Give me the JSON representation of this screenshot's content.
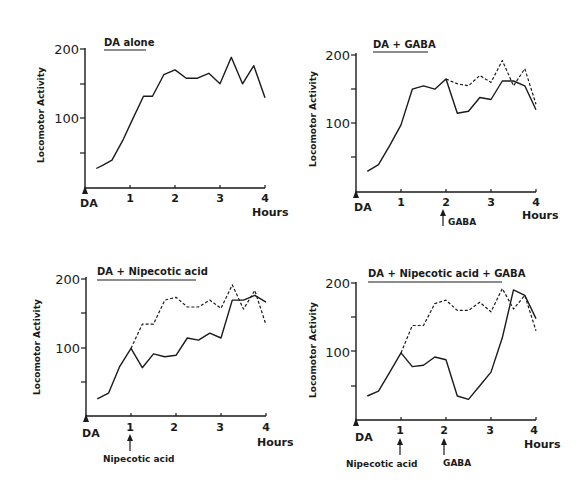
{
  "chart_data": [
    {
      "type": "line",
      "title": "DA alone",
      "xlabel": "Hours",
      "ylabel": "Locomotor Activity",
      "x_ticks": [
        "DA",
        "1",
        "2",
        "3",
        "4"
      ],
      "y_ticks": [
        "100",
        "200"
      ],
      "xlim": [
        0,
        4
      ],
      "ylim": [
        0,
        200
      ],
      "grid": false,
      "series": [
        {
          "name": "DA alone",
          "style": "solid",
          "x": [
            0.25,
            0.4,
            0.6,
            0.85,
            1.05,
            1.3,
            1.5,
            1.75,
            2.0,
            2.25,
            2.5,
            2.75,
            3.0,
            3.25,
            3.5,
            3.75,
            4.0
          ],
          "values": [
            28,
            33,
            40,
            70,
            98,
            132,
            132,
            163,
            170,
            158,
            158,
            165,
            150,
            188,
            150,
            176,
            130
          ]
        }
      ],
      "annotations": []
    },
    {
      "type": "line",
      "title": "DA + GABA",
      "xlabel": "Hours",
      "ylabel": "Locomotor Activity",
      "x_ticks": [
        "DA",
        "1",
        "2",
        "3",
        "4"
      ],
      "y_ticks": [
        "100",
        "200"
      ],
      "xlim": [
        0,
        4
      ],
      "ylim": [
        0,
        200
      ],
      "grid": false,
      "series": [
        {
          "name": "DA + GABA",
          "style": "solid",
          "x": [
            0.25,
            0.5,
            0.75,
            1.0,
            1.25,
            1.5,
            1.75,
            2.0,
            2.25,
            2.5,
            2.75,
            3.0,
            3.25,
            3.5,
            3.75,
            4.0
          ],
          "values": [
            30,
            40,
            68,
            98,
            150,
            155,
            150,
            165,
            115,
            118,
            138,
            135,
            162,
            162,
            155,
            120
          ]
        },
        {
          "name": "DA alone (reference)",
          "style": "dashed",
          "x": [
            2.0,
            2.25,
            2.5,
            2.75,
            3.0,
            3.25,
            3.5,
            3.75,
            4.0
          ],
          "values": [
            165,
            158,
            155,
            170,
            160,
            192,
            155,
            180,
            128
          ]
        }
      ],
      "annotations": [
        {
          "label": "GABA",
          "x": 2.0,
          "type": "arrow"
        }
      ]
    },
    {
      "type": "line",
      "title": "DA + Nipecotic acid",
      "xlabel": "Hours",
      "ylabel": "Locomotor Activity",
      "x_ticks": [
        "DA",
        "1",
        "2",
        "3",
        "4"
      ],
      "y_ticks": [
        "100",
        "200"
      ],
      "xlim": [
        0,
        4
      ],
      "ylim": [
        0,
        200
      ],
      "grid": false,
      "series": [
        {
          "name": "DA + Nipecotic acid",
          "style": "solid",
          "x": [
            0.25,
            0.5,
            0.75,
            1.0,
            1.25,
            1.5,
            1.75,
            2.0,
            2.25,
            2.5,
            2.75,
            3.0,
            3.25,
            3.5,
            3.75,
            4.0
          ],
          "values": [
            25,
            33,
            72,
            98,
            70,
            90,
            86,
            88,
            113,
            110,
            120,
            113,
            168,
            168,
            175,
            165
          ]
        },
        {
          "name": "DA alone (reference)",
          "style": "dashed",
          "x": [
            1.0,
            1.25,
            1.5,
            1.75,
            2.0,
            2.25,
            2.5,
            2.75,
            3.0,
            3.25,
            3.5,
            3.75,
            4.0
          ],
          "values": [
            98,
            133,
            133,
            168,
            172,
            158,
            158,
            168,
            156,
            190,
            155,
            182,
            132
          ]
        }
      ],
      "annotations": [
        {
          "label": "Nipecotic acid",
          "x": 1.0,
          "type": "arrow"
        }
      ]
    },
    {
      "type": "line",
      "title": "DA + Nipecotic acid + GABA",
      "xlabel": "Hours",
      "ylabel": "Locomotor Activity",
      "x_ticks": [
        "DA",
        "1",
        "2",
        "3",
        "4"
      ],
      "y_ticks": [
        "100",
        "200"
      ],
      "xlim": [
        0,
        4
      ],
      "ylim": [
        0,
        200
      ],
      "grid": false,
      "series": [
        {
          "name": "DA + Nipecotic acid + GABA",
          "style": "solid",
          "x": [
            0.25,
            0.5,
            0.75,
            1.0,
            1.25,
            1.5,
            1.75,
            2.0,
            2.25,
            2.5,
            2.75,
            3.0,
            3.25,
            3.5,
            3.75,
            4.0
          ],
          "values": [
            35,
            42,
            70,
            98,
            78,
            80,
            92,
            88,
            35,
            30,
            50,
            70,
            120,
            190,
            182,
            148
          ]
        },
        {
          "name": "DA alone (reference)",
          "style": "dashed",
          "x": [
            1.0,
            1.25,
            1.5,
            1.75,
            2.0,
            2.25,
            2.5,
            2.75,
            3.0,
            3.25,
            3.5,
            3.75,
            4.0
          ],
          "values": [
            98,
            138,
            138,
            170,
            175,
            160,
            160,
            172,
            158,
            192,
            162,
            182,
            130
          ]
        }
      ],
      "annotations": [
        {
          "label": "Nipecotic acid",
          "x": 1.0,
          "type": "arrow"
        },
        {
          "label": "GABA",
          "x": 2.0,
          "type": "arrow"
        }
      ]
    }
  ],
  "panels": [
    {
      "title": "DA alone",
      "ylabel": "Locomotor Activity",
      "y200": "200",
      "y100": "100",
      "x_origin": "DA",
      "x1": "1",
      "x2": "2",
      "x3": "3",
      "x4": "4",
      "xunit": "Hours"
    },
    {
      "title": "DA + GABA",
      "ylabel": "Locomotor Activity",
      "y200": "200",
      "y100": "100",
      "x_origin": "DA",
      "x1": "1",
      "x2": "2",
      "x3": "3",
      "x4": "4",
      "xunit": "Hours",
      "arrow1": "GABA"
    },
    {
      "title": "DA + Nipecotic acid",
      "ylabel": "Locomotor Activity",
      "y200": "200",
      "y100": "100",
      "x_origin": "DA",
      "x1": "1",
      "x2": "2",
      "x3": "3",
      "x4": "4",
      "xunit": "Hours",
      "arrow1": "Nipecotic acid"
    },
    {
      "title": "DA + Nipecotic acid + GABA",
      "ylabel": "Locomotor Activity",
      "y200": "200",
      "y100": "100",
      "x_origin": "DA",
      "x1": "1",
      "x2": "2",
      "x3": "3",
      "x4": "4",
      "xunit": "Hours",
      "arrow1": "Nipecotic acid",
      "arrow2": "GABA"
    }
  ]
}
